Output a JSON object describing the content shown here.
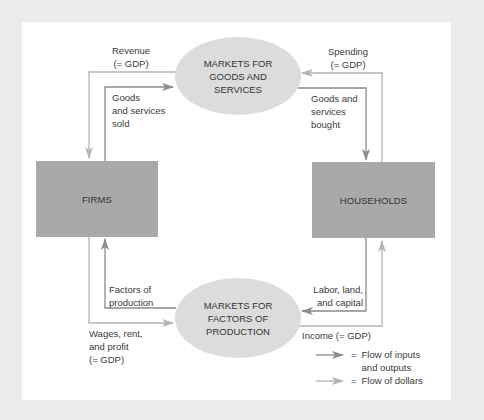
{
  "diagram": {
    "type": "circular-flow",
    "colors": {
      "background": "#ebebeb",
      "panel": "#ffffff",
      "box_fill": "#a9a9a9",
      "ellipse_fill": "#dcdcdc",
      "flow_inputs_outputs": "#8a8a8a",
      "flow_dollars": "#b4b4b4"
    },
    "nodes": {
      "firms": {
        "label": "FIRMS"
      },
      "households": {
        "label": "HOUSEHOLDS"
      },
      "goods_market": {
        "lines": [
          "MARKETS FOR",
          "GOODS AND",
          "SERVICES"
        ]
      },
      "factors_market": {
        "lines": [
          "MARKETS FOR",
          "FACTORS OF",
          "PRODUCTION"
        ]
      }
    },
    "flows": {
      "revenue": {
        "lines": [
          "Revenue",
          "(= GDP)"
        ],
        "kind": "dollars",
        "from": "goods_market",
        "to": "firms"
      },
      "goods_sold": {
        "lines": [
          "Goods",
          "and services",
          "sold"
        ],
        "kind": "inputs_outputs",
        "from": "firms",
        "to": "goods_market"
      },
      "spending": {
        "lines": [
          "Spending",
          "(= GDP)"
        ],
        "kind": "dollars",
        "from": "households",
        "to": "goods_market"
      },
      "goods_bought": {
        "lines": [
          "Goods and",
          "services",
          "bought"
        ],
        "kind": "inputs_outputs",
        "from": "goods_market",
        "to": "households"
      },
      "factors": {
        "lines": [
          "Factors of",
          "production"
        ],
        "kind": "inputs_outputs",
        "from": "factors_market",
        "to": "firms"
      },
      "wages": {
        "lines": [
          "Wages, rent,",
          "and profit",
          "(= GDP)"
        ],
        "kind": "dollars",
        "from": "firms",
        "to": "factors_market"
      },
      "labor": {
        "lines": [
          "Labor, land,",
          "and capital"
        ],
        "kind": "inputs_outputs",
        "from": "households",
        "to": "factors_market"
      },
      "income": {
        "label": "Income (= GDP)",
        "kind": "dollars",
        "from": "factors_market",
        "to": "households"
      }
    },
    "legend": {
      "items": [
        {
          "symbol": "=",
          "lines": [
            "Flow of inputs",
            "and outputs"
          ],
          "kind": "inputs_outputs"
        },
        {
          "symbol": "=",
          "lines": [
            "Flow of dollars"
          ],
          "kind": "dollars"
        }
      ]
    }
  }
}
